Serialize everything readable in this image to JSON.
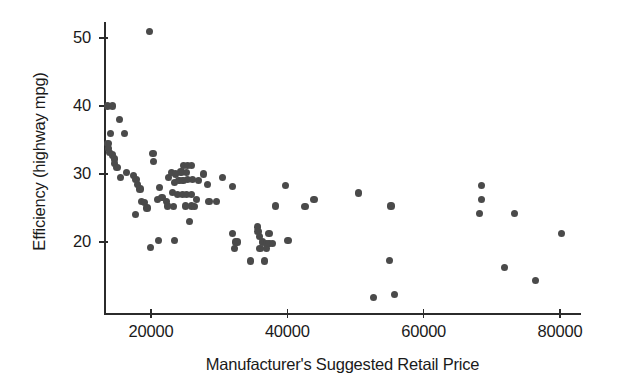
{
  "chart_data": {
    "type": "scatter",
    "title": "",
    "xlabel": "Manufacturer's Suggested Retail Price",
    "ylabel": "Efficiency (highway mpg)",
    "xlim": [
      13000,
      82000
    ],
    "ylim": [
      10.5,
      52.5
    ],
    "xticks": [
      20000,
      40000,
      60000,
      80000
    ],
    "xtick_labels": [
      "20000",
      "40000",
      "60000",
      "80000"
    ],
    "yticks": [
      20,
      30,
      40,
      50
    ],
    "ytick_labels": [
      "20",
      "30",
      "40",
      "50"
    ],
    "grid": false,
    "legend": null,
    "marker_color": "#4a4a4a",
    "axis_color": "#2b2b2b",
    "points": [
      [
        19800,
        51.0
      ],
      [
        13600,
        40.0
      ],
      [
        14300,
        40.0
      ],
      [
        15400,
        38.0
      ],
      [
        14000,
        36.0
      ],
      [
        16100,
        36.0
      ],
      [
        13700,
        34.5
      ],
      [
        13800,
        33.8
      ],
      [
        13900,
        33.2
      ],
      [
        14300,
        32.8
      ],
      [
        14600,
        32.2
      ],
      [
        14700,
        31.5
      ],
      [
        15000,
        31.0
      ],
      [
        20300,
        33.0
      ],
      [
        20400,
        31.8
      ],
      [
        16400,
        30.2
      ],
      [
        17400,
        29.8
      ],
      [
        15500,
        29.5
      ],
      [
        17800,
        29.2
      ],
      [
        18000,
        28.4
      ],
      [
        18400,
        27.8
      ],
      [
        21300,
        28.0
      ],
      [
        18600,
        26.0
      ],
      [
        19000,
        25.8
      ],
      [
        19400,
        25.0
      ],
      [
        21000,
        26.2
      ],
      [
        21600,
        26.5
      ],
      [
        22300,
        26.0
      ],
      [
        17700,
        24.0
      ],
      [
        22600,
        29.5
      ],
      [
        23000,
        30.2
      ],
      [
        23600,
        30.0
      ],
      [
        24400,
        30.3
      ],
      [
        24800,
        31.3
      ],
      [
        25400,
        31.3
      ],
      [
        26000,
        31.3
      ],
      [
        25200,
        30.2
      ],
      [
        23500,
        28.8
      ],
      [
        24100,
        29.0
      ],
      [
        24700,
        29.0
      ],
      [
        25300,
        29.2
      ],
      [
        26100,
        29.2
      ],
      [
        27000,
        29.0
      ],
      [
        27700,
        30.0
      ],
      [
        28300,
        28.5
      ],
      [
        30500,
        29.5
      ],
      [
        31900,
        28.2
      ],
      [
        23200,
        27.3
      ],
      [
        23900,
        27.0
      ],
      [
        24600,
        27.0
      ],
      [
        25200,
        27.0
      ],
      [
        25900,
        27.0
      ],
      [
        26700,
        26.3
      ],
      [
        28500,
        26.0
      ],
      [
        29600,
        26.0
      ],
      [
        22400,
        25.3
      ],
      [
        23300,
        25.2
      ],
      [
        25100,
        25.3
      ],
      [
        25900,
        25.3
      ],
      [
        26400,
        25.2
      ],
      [
        25600,
        23.0
      ],
      [
        19900,
        19.2
      ],
      [
        21100,
        20.2
      ],
      [
        23400,
        20.2
      ],
      [
        32000,
        21.2
      ],
      [
        32400,
        20.0
      ],
      [
        32700,
        20.0
      ],
      [
        32300,
        19.0
      ],
      [
        35600,
        22.2
      ],
      [
        35700,
        21.5
      ],
      [
        35900,
        20.8
      ],
      [
        37300,
        21.2
      ],
      [
        36400,
        20.0
      ],
      [
        36900,
        19.8
      ],
      [
        37300,
        19.8
      ],
      [
        37800,
        19.8
      ],
      [
        40100,
        20.2
      ],
      [
        36000,
        19.0
      ],
      [
        36900,
        19.0
      ],
      [
        34600,
        17.2
      ],
      [
        36700,
        17.2
      ],
      [
        39700,
        28.3
      ],
      [
        38300,
        25.3
      ],
      [
        42600,
        25.2
      ],
      [
        43900,
        26.3
      ],
      [
        50400,
        27.2
      ],
      [
        55200,
        25.3
      ],
      [
        68500,
        28.3
      ],
      [
        68500,
        26.3
      ],
      [
        68200,
        24.2
      ],
      [
        73300,
        24.2
      ],
      [
        80200,
        21.2
      ],
      [
        55000,
        17.3
      ],
      [
        71900,
        16.2
      ],
      [
        76400,
        14.3
      ],
      [
        52700,
        11.8
      ],
      [
        55700,
        12.3
      ]
    ]
  }
}
